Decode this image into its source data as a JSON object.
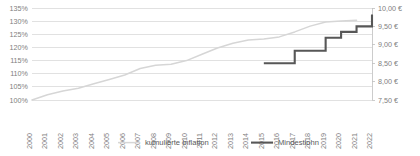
{
  "chart_data": {
    "type": "line",
    "title": "",
    "subtitle": "",
    "xlabel": "",
    "ylabel": "",
    "grid": true,
    "legend_position": "bottom",
    "x": [
      2000,
      2001,
      2002,
      2003,
      2004,
      2005,
      2006,
      2007,
      2008,
      2009,
      2010,
      2011,
      2012,
      2013,
      2014,
      2015,
      2016,
      2017,
      2018,
      2019,
      2020,
      2021,
      2022
    ],
    "categories": [
      "2000",
      "2001",
      "2002",
      "2003",
      "2004",
      "2005",
      "2006",
      "2007",
      "2008",
      "2009",
      "2010",
      "2011",
      "2012",
      "2013",
      "2014",
      "2015",
      "2016",
      "2017",
      "2018",
      "2019",
      "2020",
      "2021",
      "2022"
    ],
    "axes": {
      "left": {
        "name": "kumulierte Inflation",
        "unit": "%",
        "ylim": [
          100,
          135
        ],
        "tick_step": 5,
        "ticks": [
          100,
          105,
          110,
          115,
          120,
          125,
          130,
          135
        ],
        "tick_labels": [
          "100%",
          "105%",
          "110%",
          "115%",
          "120%",
          "125%",
          "130%",
          "135%"
        ]
      },
      "right": {
        "name": "Mindestlohn",
        "unit": "€",
        "ylim": [
          7.5,
          10.0
        ],
        "tick_step": 0.5,
        "ticks": [
          7.5,
          8.0,
          8.5,
          9.0,
          9.5,
          10.0
        ],
        "tick_labels": [
          "7,50 €",
          "8,00 €",
          "8,50 €",
          "9,00 €",
          "9,50 €",
          "10,00 €"
        ]
      }
    },
    "series": [
      {
        "name": "kumulierte Inflation",
        "axis": "left",
        "color": "#d6d6d6",
        "style": "line",
        "x": [
          2000,
          2001,
          2002,
          2003,
          2004,
          2005,
          2006,
          2007,
          2008,
          2009,
          2010,
          2011,
          2012,
          2013,
          2014,
          2015,
          2016,
          2017,
          2018,
          2019,
          2020,
          2021
        ],
        "values": [
          100.0,
          102.0,
          103.4,
          104.5,
          106.2,
          107.8,
          109.5,
          112.0,
          113.2,
          113.6,
          115.0,
          117.4,
          119.8,
          121.6,
          122.8,
          123.2,
          124.0,
          125.9,
          128.1,
          129.7,
          130.1,
          130.3
        ]
      },
      {
        "name": "Mindestlohn",
        "axis": "right",
        "color": "#575757",
        "style": "step",
        "x": [
          2015,
          2016,
          2017,
          2018,
          2019,
          2020,
          2021,
          2022
        ],
        "values": [
          8.5,
          8.5,
          8.84,
          8.84,
          9.19,
          9.35,
          9.5,
          9.82
        ]
      }
    ],
    "legend": [
      {
        "label": "kumulierte Inflation",
        "color": "#d6d6d6",
        "width": 1.5
      },
      {
        "label": "Mindestlohn",
        "color": "#575757",
        "width": 2.1
      }
    ]
  },
  "layout": {
    "plot": {
      "left": 32,
      "right": 372,
      "top": 8,
      "bottom": 100
    },
    "legend": {
      "y": 145
    }
  }
}
